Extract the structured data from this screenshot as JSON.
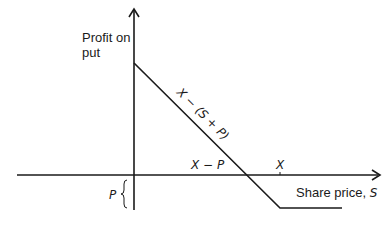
{
  "diagram": {
    "title": "Profit on put",
    "y_axis_label_line1": "Profit on",
    "y_axis_label_line2": "put",
    "x_axis_label": "Share price, S",
    "x_axis_label_prefix": "Share price, ",
    "x_axis_label_var": "S",
    "line_label": "X − (S + P)",
    "breakeven_label": "X − P",
    "strike_label": "X",
    "premium_label": "P",
    "colors": {
      "line": "#1a1a1a",
      "background": "#ffffff"
    },
    "geometry": {
      "origin": [
        134,
        175
      ],
      "y_axis_top": 8,
      "y_axis_bottom": 210,
      "x_axis_left": 17,
      "x_axis_right": 380,
      "payoff_start": [
        134,
        63
      ],
      "breakeven_point": [
        248,
        175
      ],
      "kink_point": [
        280,
        208
      ],
      "payoff_end": [
        342,
        208
      ]
    }
  }
}
